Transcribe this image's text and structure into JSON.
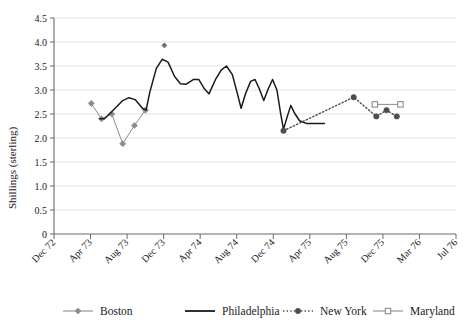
{
  "chart_data": {
    "type": "line",
    "title": "",
    "xlabel": "",
    "ylabel": "Shillings (sterling)",
    "ylim": [
      0,
      4.5
    ],
    "ytick_labels": [
      "0",
      "0.5",
      "1.0",
      "1.5",
      "2.0",
      "2.5",
      "3.0",
      "3.5",
      "4.0",
      "4.5"
    ],
    "ytick_values": [
      0,
      0.5,
      1.0,
      1.5,
      2.0,
      2.5,
      3.0,
      3.5,
      4.0,
      4.5
    ],
    "grid": true,
    "grid_axis": "y",
    "legend_position": "bottom",
    "xtick_labels": [
      "Dec 72",
      "Apr 73",
      "Aug 73",
      "Dec 73",
      "Apr 74",
      "Aug 74",
      "Dec 74",
      "Apr 75",
      "Aug 75",
      "Dec 75",
      "Mar 76",
      "Jul 76"
    ],
    "xtick_index": [
      0,
      1,
      2,
      3,
      4,
      5,
      6,
      7,
      8,
      9,
      10,
      11
    ],
    "x_axis_note": "Ticks are 4-month intervals from Dec 72 to Jul 76",
    "series": [
      {
        "name": "Boston",
        "color": "#8c8c8c",
        "marker": "diamond",
        "line_style": "solid",
        "points": [
          {
            "x": 1.02,
            "y": 2.72
          },
          {
            "x": 1.3,
            "y": 2.4
          },
          {
            "x": 1.58,
            "y": 2.5
          },
          {
            "x": 1.88,
            "y": 1.88
          },
          {
            "x": 2.2,
            "y": 2.26
          },
          {
            "x": 2.5,
            "y": 2.58
          }
        ]
      },
      {
        "name": "Philadelphia",
        "color": "#1a1a1a",
        "marker": "none",
        "line_style": "solid",
        "points": [
          {
            "x": 1.25,
            "y": 2.4
          },
          {
            "x": 1.38,
            "y": 2.4
          },
          {
            "x": 1.62,
            "y": 2.58
          },
          {
            "x": 1.88,
            "y": 2.78
          },
          {
            "x": 2.05,
            "y": 2.84
          },
          {
            "x": 2.22,
            "y": 2.8
          },
          {
            "x": 2.42,
            "y": 2.62
          },
          {
            "x": 2.52,
            "y": 2.58
          },
          {
            "x": 2.62,
            "y": 2.95
          },
          {
            "x": 2.8,
            "y": 3.45
          },
          {
            "x": 2.96,
            "y": 3.64
          },
          {
            "x": 3.12,
            "y": 3.58
          },
          {
            "x": 3.3,
            "y": 3.28
          },
          {
            "x": 3.46,
            "y": 3.13
          },
          {
            "x": 3.62,
            "y": 3.12
          },
          {
            "x": 3.82,
            "y": 3.22
          },
          {
            "x": 3.96,
            "y": 3.22
          },
          {
            "x": 4.12,
            "y": 3.02
          },
          {
            "x": 4.24,
            "y": 2.92
          },
          {
            "x": 4.42,
            "y": 3.22
          },
          {
            "x": 4.58,
            "y": 3.42
          },
          {
            "x": 4.72,
            "y": 3.5
          },
          {
            "x": 4.88,
            "y": 3.32
          },
          {
            "x": 5.02,
            "y": 2.92
          },
          {
            "x": 5.12,
            "y": 2.62
          },
          {
            "x": 5.24,
            "y": 2.92
          },
          {
            "x": 5.38,
            "y": 3.18
          },
          {
            "x": 5.5,
            "y": 3.22
          },
          {
            "x": 5.62,
            "y": 3.02
          },
          {
            "x": 5.74,
            "y": 2.78
          },
          {
            "x": 5.86,
            "y": 3.02
          },
          {
            "x": 5.98,
            "y": 3.22
          },
          {
            "x": 6.1,
            "y": 3.0
          },
          {
            "x": 6.2,
            "y": 2.52
          },
          {
            "x": 6.28,
            "y": 2.18
          },
          {
            "x": 6.38,
            "y": 2.44
          },
          {
            "x": 6.48,
            "y": 2.68
          },
          {
            "x": 6.58,
            "y": 2.52
          },
          {
            "x": 6.72,
            "y": 2.36
          },
          {
            "x": 6.92,
            "y": 2.3
          },
          {
            "x": 7.2,
            "y": 2.3
          },
          {
            "x": 7.4,
            "y": 2.3
          }
        ],
        "isolated_points": [
          {
            "x": 3.02,
            "y": 3.93
          }
        ]
      },
      {
        "name": "New York",
        "color": "#4d4d4d",
        "marker": "circle",
        "line_style": "dotted",
        "points": [
          {
            "x": 6.28,
            "y": 2.15
          },
          {
            "x": 8.2,
            "y": 2.85
          },
          {
            "x": 8.82,
            "y": 2.45
          },
          {
            "x": 9.1,
            "y": 2.58
          },
          {
            "x": 9.38,
            "y": 2.45
          }
        ]
      },
      {
        "name": "Maryland",
        "color": "#8c8c8c",
        "marker": "square",
        "line_style": "solid",
        "points": [
          {
            "x": 8.78,
            "y": 2.7
          },
          {
            "x": 9.48,
            "y": 2.7
          }
        ]
      }
    ]
  },
  "legend": {
    "items": [
      {
        "label": "Boston",
        "color": "#8c8c8c",
        "marker": "diamond",
        "line_style": "solid"
      },
      {
        "label": "Philadelphia",
        "color": "#1a1a1a",
        "marker": "none",
        "line_style": "solid"
      },
      {
        "label": "New York",
        "color": "#4d4d4d",
        "marker": "circle",
        "line_style": "dotted"
      },
      {
        "label": "Maryland",
        "color": "#8c8c8c",
        "marker": "square",
        "line_style": "solid"
      }
    ]
  }
}
